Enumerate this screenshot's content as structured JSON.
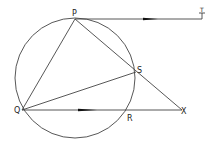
{
  "diagram": {
    "type": "circle-geometry",
    "circle": {
      "cx": 75,
      "cy": 78,
      "r": 60
    },
    "points": {
      "P": {
        "label": "P",
        "x": 75,
        "y": 19
      },
      "T": {
        "label": "T",
        "x": 202,
        "y": 19
      },
      "S": {
        "label": "S",
        "x": 136,
        "y": 72
      },
      "Q": {
        "label": "Q",
        "x": 22,
        "y": 110
      },
      "R": {
        "label": "R",
        "x": 129,
        "y": 110
      },
      "X": {
        "label": "X",
        "x": 182,
        "y": 110
      }
    },
    "segments": [
      [
        "P",
        "T"
      ],
      [
        "P",
        "Q"
      ],
      [
        "P",
        "X"
      ],
      [
        "Q",
        "S"
      ],
      [
        "Q",
        "X"
      ]
    ],
    "parallel_marks": [
      "PT",
      "QX"
    ],
    "stroke_color": "#444444"
  },
  "labels": {
    "P": "P",
    "T": "T",
    "S": "S",
    "Q": "Q",
    "R": "R",
    "X": "X"
  }
}
